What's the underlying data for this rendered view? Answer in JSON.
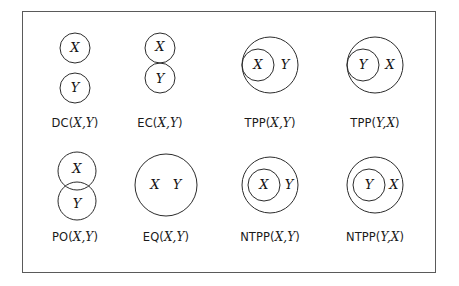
{
  "figure": {
    "width": 459,
    "height": 286,
    "background_color": "#ffffff",
    "frame": {
      "border_color": "#5a5a5a",
      "border_width": 1,
      "x": 22,
      "y": 11,
      "width": 414,
      "height": 262
    },
    "stroke_color": "#2b2b2b",
    "text_color": "#141414"
  },
  "regions": {
    "x_label": "X",
    "y_label": "Y"
  },
  "cells": [
    {
      "id": "dc",
      "relation": "DC",
      "label_prefix": "DC(",
      "label_args": "X,Y",
      "label_suffix": ")",
      "label_full": "DC(X,Y)",
      "description": "disconnected: two separate circles, X above Y",
      "row": 0,
      "col": 0,
      "shapes": [
        {
          "name": "circle-x",
          "label": "X",
          "cx": 75,
          "cy": 48,
          "r": 15
        },
        {
          "name": "circle-y",
          "label": "Y",
          "cx": 75,
          "cy": 88,
          "r": 15
        }
      ],
      "label_y": 110
    },
    {
      "id": "ec",
      "relation": "EC",
      "label_prefix": "EC(",
      "label_args": "X,Y",
      "label_suffix": ")",
      "label_full": "EC(X,Y)",
      "description": "externally connected: circles touch at one point",
      "row": 0,
      "col": 1,
      "shapes": [
        {
          "name": "circle-x",
          "label": "X",
          "cx": 160,
          "cy": 48,
          "r": 15
        },
        {
          "name": "circle-y",
          "label": "Y",
          "cx": 160,
          "cy": 78,
          "r": 15
        }
      ],
      "label_y": 110
    },
    {
      "id": "tpp-xy",
      "relation": "TPP",
      "label_prefix": "TPP(",
      "label_args": "X,Y",
      "label_suffix": ")",
      "label_full": "TPP(X,Y)",
      "description": "tangential proper part: X inside Y, touching boundary on left",
      "row": 0,
      "col": 2,
      "shapes": [
        {
          "name": "circle-y",
          "label": "Y",
          "cx": 270,
          "cy": 65,
          "r": 28,
          "label_dx": 12
        },
        {
          "name": "circle-x",
          "label": "X",
          "cx": 258,
          "cy": 65,
          "r": 16
        }
      ],
      "label_y": 110
    },
    {
      "id": "tpp-yx",
      "relation": "TPP",
      "label_prefix": "TPP(",
      "label_args": "Y,X",
      "label_suffix": ")",
      "label_full": "TPP(Y,X)",
      "description": "tangential proper part: Y inside X, touching boundary on left",
      "row": 0,
      "col": 3,
      "shapes": [
        {
          "name": "circle-x",
          "label": "X",
          "cx": 375,
          "cy": 65,
          "r": 28,
          "label_dx": 12
        },
        {
          "name": "circle-y",
          "label": "Y",
          "cx": 363,
          "cy": 65,
          "r": 16
        }
      ],
      "label_y": 110
    },
    {
      "id": "po",
      "relation": "PO",
      "label_prefix": "PO(",
      "label_args": "X,Y",
      "label_suffix": ")",
      "label_full": "PO(X,Y)",
      "description": "partial overlap: two circles intersect",
      "row": 1,
      "col": 0,
      "shapes": [
        {
          "name": "circle-x",
          "label": "X",
          "cx": 77,
          "cy": 171,
          "r": 19,
          "label_dy": -2
        },
        {
          "name": "circle-y",
          "label": "Y",
          "cx": 77,
          "cy": 201,
          "r": 19,
          "label_dy": 3
        }
      ],
      "label_y": 230
    },
    {
      "id": "eq",
      "relation": "EQ",
      "label_prefix": "EQ(",
      "label_args": "X,Y",
      "label_suffix": ")",
      "label_full": "EQ(X,Y)",
      "description": "equal: one circle containing both labels X and Y",
      "row": 1,
      "col": 1,
      "shapes": [
        {
          "name": "circle-xy",
          "label": "",
          "cx": 166,
          "cy": 185,
          "r": 31
        }
      ],
      "label_y": 230
    },
    {
      "id": "ntpp-xy",
      "relation": "NTPP",
      "label_prefix": "NTPP(",
      "label_args": "X,Y",
      "label_suffix": ")",
      "label_full": "NTPP(X,Y)",
      "description": "non-tangential proper part: X strictly inside Y",
      "row": 1,
      "col": 2,
      "shapes": [
        {
          "name": "circle-y",
          "label": "Y",
          "cx": 270,
          "cy": 185,
          "r": 28,
          "label_dx": 18
        },
        {
          "name": "circle-x",
          "label": "X",
          "cx": 264,
          "cy": 185,
          "r": 16
        }
      ],
      "label_y": 230
    },
    {
      "id": "ntpp-yx",
      "relation": "NTPP",
      "label_prefix": "NTPP(",
      "label_args": "Y,X",
      "label_suffix": ")",
      "label_full": "NTPP(Y,X)",
      "description": "non-tangential proper part: Y strictly inside X",
      "row": 1,
      "col": 3,
      "shapes": [
        {
          "name": "circle-x",
          "label": "X",
          "cx": 375,
          "cy": 185,
          "r": 28,
          "label_dx": 18
        },
        {
          "name": "circle-y",
          "label": "Y",
          "cx": 369,
          "cy": 185,
          "r": 16
        }
      ],
      "label_y": 230
    }
  ],
  "eq_inner_labels": {
    "x": "X",
    "y": "Y"
  }
}
